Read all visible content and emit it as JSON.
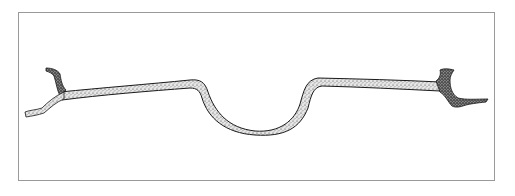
{
  "illustration": {
    "subject": "stippled drawing of a bent twig/branch",
    "frame_color": "#9a9a9a",
    "ink_color": "#1a1a1a",
    "fill_color": "#d9d9d9"
  }
}
